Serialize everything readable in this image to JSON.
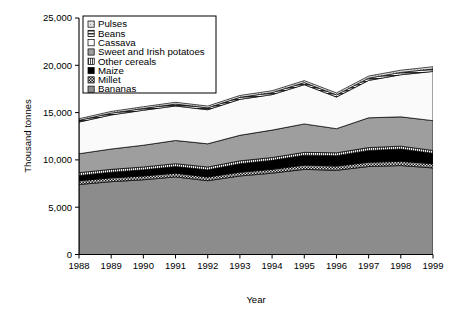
{
  "chart_data": {
    "type": "area",
    "stacked": true,
    "title": "",
    "xlabel": "Year",
    "ylabel": "Thousand tonnes",
    "categories": [
      "1988",
      "1989",
      "1990",
      "1991",
      "1992",
      "1993",
      "1994",
      "1995",
      "1996",
      "1997",
      "1998",
      "1999"
    ],
    "x": [
      1988,
      1989,
      1990,
      1991,
      1992,
      1993,
      1994,
      1995,
      1996,
      1997,
      1998,
      1999
    ],
    "xlim": [
      1988,
      1999
    ],
    "ylim": [
      0,
      25000
    ],
    "yticks": [
      0,
      5000,
      10000,
      15000,
      20000,
      25000
    ],
    "ytick_labels": [
      "0",
      "5,000",
      "10,000",
      "15,000",
      "20,000",
      "25,000"
    ],
    "xticks": [
      1988,
      1989,
      1990,
      1991,
      1992,
      1993,
      1994,
      1995,
      1996,
      1997,
      1998,
      1999
    ],
    "grid": false,
    "legend_position": "top-left-inside",
    "stack_order_bottom_to_top": [
      "Bananas",
      "Millet",
      "Maize",
      "Other cereals",
      "Sweet and Irish potatoes",
      "Cassava",
      "Beans",
      "Pulses"
    ],
    "series": [
      {
        "name": "Bananas",
        "color": "#8c8c8c",
        "pattern": "solid-gray",
        "values": [
          7400,
          7700,
          7900,
          8200,
          7800,
          8300,
          8600,
          9000,
          8900,
          9300,
          9400,
          9150
        ]
      },
      {
        "name": "Millet",
        "color": "#3a3a3a",
        "pattern": "checker",
        "values": [
          400,
          400,
          400,
          400,
          400,
          400,
          400,
          450,
          450,
          450,
          450,
          450
        ]
      },
      {
        "name": "Maize",
        "color": "#000000",
        "pattern": "solid-black",
        "values": [
          550,
          600,
          650,
          700,
          750,
          900,
          950,
          1050,
          1100,
          1250,
          1300,
          1100
        ]
      },
      {
        "name": "Other cereals",
        "color": "#d8d8d8",
        "pattern": "vertical-stripe",
        "values": [
          300,
          300,
          300,
          300,
          300,
          300,
          300,
          300,
          300,
          300,
          300,
          300
        ]
      },
      {
        "name": "Sweet and Irish potatoes",
        "color": "#9e9e9e",
        "pattern": "solid-midgray",
        "values": [
          2000,
          2150,
          2300,
          2450,
          2450,
          2700,
          2900,
          3000,
          2550,
          3150,
          3100,
          3150
        ]
      },
      {
        "name": "Cassava",
        "color": "#f7f7f7",
        "pattern": "white",
        "values": [
          3350,
          3600,
          3700,
          3650,
          3600,
          3800,
          3750,
          4150,
          3350,
          3950,
          4450,
          5200
        ]
      },
      {
        "name": "Beans",
        "color": "#4f4f4f",
        "pattern": "horizontal-hatch",
        "values": [
          180,
          190,
          190,
          200,
          200,
          210,
          210,
          220,
          220,
          240,
          250,
          260
        ]
      },
      {
        "name": "Pulses",
        "color": "#bdbdbd",
        "pattern": "light-dots",
        "values": [
          170,
          180,
          180,
          190,
          190,
          200,
          200,
          210,
          210,
          220,
          230,
          240
        ]
      }
    ],
    "totals": [
      14350,
      14920,
      15420,
      16090,
      15690,
      16810,
      17310,
      18380,
      17080,
      18860,
      19480,
      19850
    ],
    "annotations": []
  },
  "legend": {
    "items": [
      {
        "label": "Pulses",
        "swatch": "light-dots"
      },
      {
        "label": "Beans",
        "swatch": "horizontal-hatch"
      },
      {
        "label": "Cassava",
        "swatch": "white"
      },
      {
        "label": "Sweet and Irish potatoes",
        "swatch": "solid-midgray"
      },
      {
        "label": "Other cereals",
        "swatch": "vertical-stripe"
      },
      {
        "label": "Maize",
        "swatch": "solid-black"
      },
      {
        "label": "Millet",
        "swatch": "checker"
      },
      {
        "label": "Bananas",
        "swatch": "solid-gray"
      }
    ]
  },
  "axes": {
    "y_title": "Thousand tonnes",
    "x_title": "Year",
    "y_ticks": [
      "25,000",
      "20,000",
      "15,000",
      "10,000",
      "5,000",
      "0"
    ],
    "x_ticks": [
      "1988",
      "1989",
      "1990",
      "1991",
      "1992",
      "1993",
      "1994",
      "1995",
      "1996",
      "1997",
      "1998",
      "1999"
    ]
  }
}
